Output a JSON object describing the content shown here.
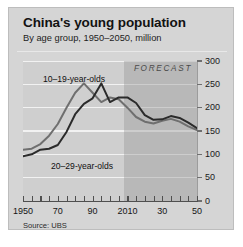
{
  "chart_data": {
    "type": "line",
    "title": "China's young population",
    "subtitle": "By age group, 1950–2050, million",
    "source": "Source: UBS",
    "xlabel": "",
    "ylabel": "",
    "ylim": [
      0,
      300
    ],
    "xlim": [
      1950,
      2050
    ],
    "yticks": [
      0,
      50,
      100,
      150,
      200,
      250,
      300
    ],
    "ytick_labels": [
      "0",
      "50",
      "100",
      "150",
      "200",
      "250",
      "300"
    ],
    "xticks": [
      1950,
      1970,
      1990,
      2010,
      2030,
      2050
    ],
    "xtick_labels": [
      "1950",
      "70",
      "90",
      "2010",
      "30",
      "50"
    ],
    "xtick_minor_step": 5,
    "grid": true,
    "legend": "inline-labels",
    "annotations": [
      {
        "text": "FORECAST",
        "x": 2022,
        "y": 285
      },
      {
        "text": "10–19-year-olds",
        "x": 1966,
        "y": 262
      },
      {
        "text": "20–29-year-olds",
        "x": 1972,
        "y": 68
      }
    ],
    "forecast_region": {
      "start": 2008,
      "end": 2050,
      "label": "FORECAST"
    },
    "series": [
      {
        "name": "10–19-year-olds",
        "color": "#6f6f6f",
        "x": [
          1950,
          1955,
          1960,
          1965,
          1970,
          1975,
          1980,
          1985,
          1990,
          1995,
          2000,
          2005,
          2010,
          2015,
          2020,
          2025,
          2030,
          2035,
          2040,
          2045,
          2050
        ],
        "values": [
          110,
          112,
          122,
          140,
          165,
          200,
          232,
          252,
          232,
          212,
          222,
          218,
          200,
          180,
          170,
          166,
          172,
          176,
          170,
          160,
          152
        ]
      },
      {
        "name": "20–29-year-olds",
        "color": "#2b2b2b",
        "x": [
          1950,
          1955,
          1960,
          1965,
          1970,
          1975,
          1980,
          1985,
          1990,
          1995,
          2000,
          2005,
          2010,
          2015,
          2020,
          2025,
          2030,
          2035,
          2040,
          2045,
          2050
        ],
        "values": [
          96,
          100,
          110,
          112,
          120,
          148,
          186,
          208,
          220,
          252,
          212,
          222,
          222,
          210,
          184,
          174,
          175,
          182,
          178,
          168,
          156
        ]
      }
    ]
  },
  "card": {
    "title": "China's young population",
    "subtitle": "By age group, 1950–2050, million",
    "source": "Source: UBS",
    "forecast_label": "FORECAST",
    "label_1019": "10–19-year-olds",
    "label_2029": "20–29-year-olds"
  },
  "colors": {
    "card_background": "#d5d5d5",
    "plot_background": "#cfcfcf",
    "forecast_shade": "#9c9c9c",
    "gridline": "#f2f2f2",
    "series_1019": "#6f6f6f",
    "series_2029": "#2b2b2b",
    "axis": "#4f4f4f",
    "text": "#121212"
  }
}
